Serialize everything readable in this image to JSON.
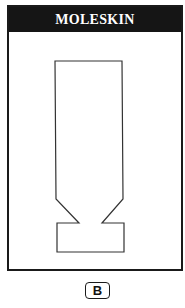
{
  "panel": {
    "title": "MOLESKIN",
    "shape": {
      "description": "tall rectangle with chamfered notch waist and rectangular base",
      "stroke": "#333333",
      "points": [
        [
          55,
          61
        ],
        [
          122,
          61
        ],
        [
          123,
          199
        ],
        [
          102,
          223
        ],
        [
          124,
          223
        ],
        [
          124,
          252
        ],
        [
          57,
          252
        ],
        [
          57,
          223
        ],
        [
          79,
          223
        ],
        [
          56,
          199
        ]
      ]
    }
  },
  "label": {
    "text": "B"
  },
  "colors": {
    "header_bg": "#151515",
    "header_text": "#ffffff",
    "border": "#1a1a1a"
  }
}
